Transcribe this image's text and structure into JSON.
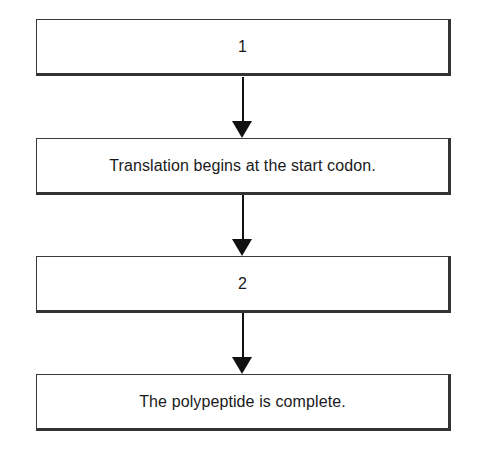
{
  "diagram": {
    "type": "flowchart",
    "direction": "top-to-bottom",
    "steps": [
      {
        "label": "1"
      },
      {
        "label": "Translation begins at the start codon."
      },
      {
        "label": "2"
      },
      {
        "label": "The polypeptide is complete."
      }
    ],
    "connections": [
      {
        "from": 0,
        "to": 1
      },
      {
        "from": 1,
        "to": 2
      },
      {
        "from": 2,
        "to": 3
      }
    ],
    "colors": {
      "border": "#333333",
      "arrow": "#111111",
      "background": "#ffffff",
      "text": "#1a1a1a"
    }
  }
}
